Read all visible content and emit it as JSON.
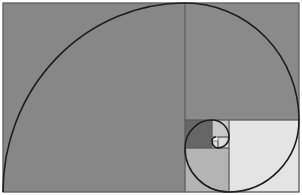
{
  "diagram": {
    "colors": {
      "background": "#ffffff",
      "large_square": "#878787",
      "top_right_square": "#8a8a8a",
      "light_square": "#e4e4e4",
      "lower_square": "#b4b4b4",
      "dark_square": "#666666",
      "small_square": "#c9c9c9",
      "tiny_square": "#dcdcdc",
      "grid_line": "#5e5e5e",
      "spiral": "#1e1e1e"
    },
    "squares": [
      {
        "name": "square-1",
        "x": 3,
        "y": 3,
        "w": 182,
        "h": 189,
        "fill": "large_square"
      },
      {
        "name": "square-2",
        "x": 185,
        "y": 3,
        "w": 114,
        "h": 117,
        "fill": "top_right_square"
      },
      {
        "name": "square-3",
        "x": 229,
        "y": 120,
        "w": 70,
        "h": 72,
        "fill": "light_square"
      },
      {
        "name": "square-4",
        "x": 185,
        "y": 148,
        "w": 44,
        "h": 44,
        "fill": "lower_square"
      },
      {
        "name": "square-5",
        "x": 185,
        "y": 120,
        "w": 27,
        "h": 28,
        "fill": "dark_square"
      },
      {
        "name": "square-6",
        "x": 212,
        "y": 120,
        "w": 17,
        "h": 17,
        "fill": "small_square"
      },
      {
        "name": "square-7",
        "x": 218,
        "y": 137,
        "w": 11,
        "h": 11,
        "fill": "tiny_square"
      },
      {
        "name": "square-8",
        "x": 212,
        "y": 141,
        "w": 6,
        "h": 7,
        "fill": "tiny_square"
      }
    ],
    "spiral_path": "M3,192 A182,189 0 0 1 185,3 A114,117 0 0 1 299,120 A70,72 0 0 1 229,192 A44,44 0 0 1 185,148 A27,28 0 0 1 212,120 A17,17 0 0 1 229,137 A11,11 0 0 1 218,148 A6,7 0 0 1 212,141 A4,4 0 0 1 216,137"
  }
}
